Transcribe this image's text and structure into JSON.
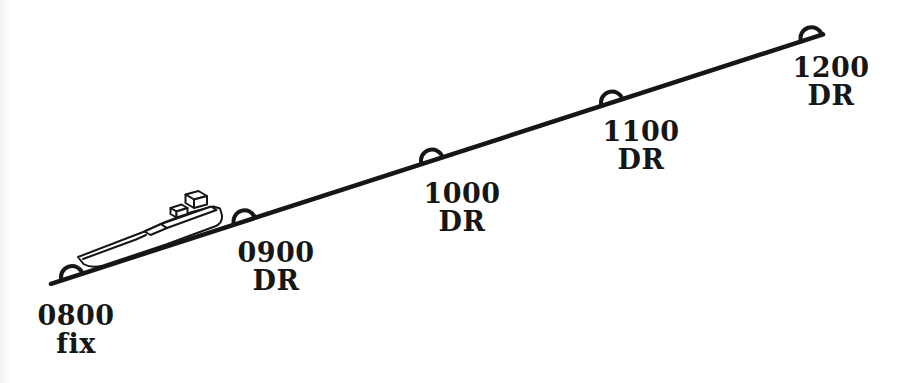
{
  "figure": {
    "background": "#ffffff",
    "ink": "#161616",
    "track": {
      "x1": 51,
      "y1": 283.8,
      "x2": 823,
      "y2": 34.4,
      "stroke_width": 4.5,
      "angle_deg": -17.9
    },
    "marker": {
      "radius": 11,
      "stroke_width": 4
    },
    "points": [
      {
        "time": "0800",
        "type": "fix",
        "x": 72,
        "y": 277,
        "label_cx": 76,
        "label_top": 302
      },
      {
        "time": "0900",
        "type": "DR",
        "x": 244.5,
        "y": 221.3,
        "label_cx": 276,
        "label_top": 239
      },
      {
        "time": "1000",
        "type": "DR",
        "x": 432,
        "y": 160.5,
        "label_cx": 462,
        "label_top": 180
      },
      {
        "time": "1100",
        "type": "DR",
        "x": 612,
        "y": 102.5,
        "label_cx": 641,
        "label_top": 118
      },
      {
        "time": "1200",
        "type": "DR",
        "x": 811.5,
        "y": 38.2,
        "label_cx": 831,
        "label_top": 54
      }
    ],
    "ship": {
      "x": 70,
      "y": 180
    }
  }
}
